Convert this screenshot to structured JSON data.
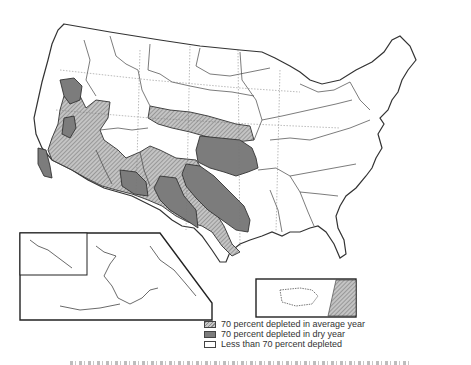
{
  "figure": {
    "insets": [
      {
        "name": "Hawaii and Alaska",
        "position": "lower-left"
      },
      {
        "name": "Puerto Rico",
        "position": "lower-right",
        "labels": [
          "Car"
        ]
      }
    ]
  },
  "legend": {
    "items": [
      {
        "label": "70 percent depleted in average year",
        "pattern": "hatched",
        "color": "#a8a8a8"
      },
      {
        "label": "70 percent depleted in dry year",
        "pattern": "solid",
        "color": "#7c7c7c"
      },
      {
        "label": "Less than 70 percent depleted",
        "pattern": "none",
        "color": "#ffffff"
      }
    ]
  },
  "colors": {
    "boundary": "#333333",
    "average_fill": "#a8a8a8",
    "dry_fill": "#7c7c7c",
    "background": "#ffffff"
  }
}
